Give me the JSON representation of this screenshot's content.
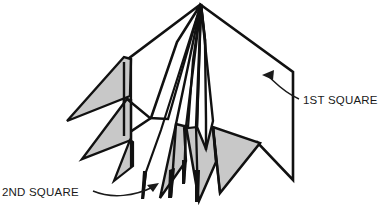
{
  "figure": {
    "background_color": "#ffffff",
    "ink_color": "#111111",
    "shade_color": "#c8c8c8",
    "white_facet_color": "#ffffff"
  },
  "labels": [
    {
      "id": "first-square",
      "text": "1ST SQUARE",
      "text_x": 303,
      "text_y": 104,
      "arrow_tip_x": 262,
      "arrow_tip_y": 75,
      "arrow_points_to": "right-white-panel"
    },
    {
      "id": "second-square",
      "text": "2ND SQUARE",
      "text_x": 2,
      "text_y": 196,
      "arrow_tip_x": 159,
      "arrow_tip_y": 183,
      "arrow_points_to": "lower-center-flaps"
    }
  ],
  "geometry": {
    "apex": {
      "x": 201,
      "y": 3
    },
    "white_facets": [
      {
        "name": "upper-left-white-panel",
        "points": "201,4 124,62 124,135 150,118 176,42"
      },
      {
        "name": "right-white-panel",
        "points": "201,5 293,72 293,180 256,141 215,160 206,120 205,40"
      },
      {
        "name": "center-white-wedge",
        "points": "201,5 213,120 206,148 197,126"
      }
    ],
    "shaded_facets": [
      {
        "name": "upper-left-gray-flap",
        "points": "124,58 67,121 131,96 132,59"
      },
      {
        "name": "lower-left-gray-flap",
        "points": "128,99 82,159 132,140 132,100"
      },
      {
        "name": "center-left-gray-flap",
        "points": "131,141 115,180 133,166 133,142"
      },
      {
        "name": "lower-center-gray-flap-a",
        "points": "176,125 160,197 185,161 183,126"
      },
      {
        "name": "lower-center-gray-flap-b",
        "points": "185,126 198,200 215,162 212,128"
      },
      {
        "name": "lower-right-gray-fan",
        "points": "214,128 219,192 259,143"
      }
    ],
    "spine_lines": [
      {
        "name": "spine-1",
        "points": "201,4 185,128 183,182"
      },
      {
        "name": "spine-2",
        "points": "201,4 176,124 172,196"
      },
      {
        "name": "spine-3",
        "points": "201,4 196,126 197,200"
      },
      {
        "name": "spine-4",
        "points": "201,4 205,40 206,120 206,150"
      },
      {
        "name": "spine-5",
        "points": "201,4 168,119 151,118 128,99"
      },
      {
        "name": "spine-6",
        "points": "201,4 160,131 146,171 143,198"
      }
    ]
  }
}
